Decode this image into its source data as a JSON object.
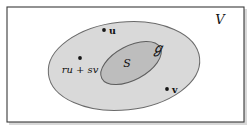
{
  "figure": {
    "kind": "set-diagram",
    "width": 250,
    "height": 133
  },
  "labels": {
    "ambient_space": "V",
    "subspace_script": "ℊ",
    "subspace_inner": "S",
    "point_u": "u",
    "point_v": "v",
    "linear_combination": "ru + sv"
  },
  "regions": [
    {
      "name": "ambient-space-frame",
      "label": "V",
      "shape": "rectangle",
      "fill": "#ffffff",
      "stroke": "#3a3a3a"
    },
    {
      "name": "outer-subspace",
      "label": "ℊ",
      "shape": "ellipse",
      "cx": 124,
      "cy": 66,
      "rx": 76,
      "ry": 44,
      "rotation": -6,
      "fill": "#d9d9d9",
      "stroke": "#6a6a6a"
    },
    {
      "name": "inner-subspace",
      "label": "S",
      "shape": "ellipse",
      "cx": 131,
      "cy": 63,
      "rx": 33,
      "ry": 17,
      "rotation": -28,
      "fill": "#bdbdbd",
      "stroke": "#5e5e5e"
    }
  ],
  "points": [
    {
      "name": "point-u",
      "label": "u",
      "x": 104,
      "y": 30,
      "label_side": "right"
    },
    {
      "name": "point-v",
      "label": "v",
      "x": 167,
      "y": 89,
      "label_side": "right"
    },
    {
      "name": "point-ru-sv",
      "label": "ru + sv",
      "x": 80,
      "y": 58,
      "label_side": "below"
    }
  ],
  "colors": {
    "background": "#ffffff",
    "frame_stroke": "#3a3a3a",
    "outer_fill": "#d9d9d9",
    "outer_stroke": "#6a6a6a",
    "inner_fill": "#bdbdbd",
    "inner_stroke": "#5e5e5e",
    "dot": "#161616",
    "text": "#121212",
    "shadow": "#b8b8b8"
  }
}
